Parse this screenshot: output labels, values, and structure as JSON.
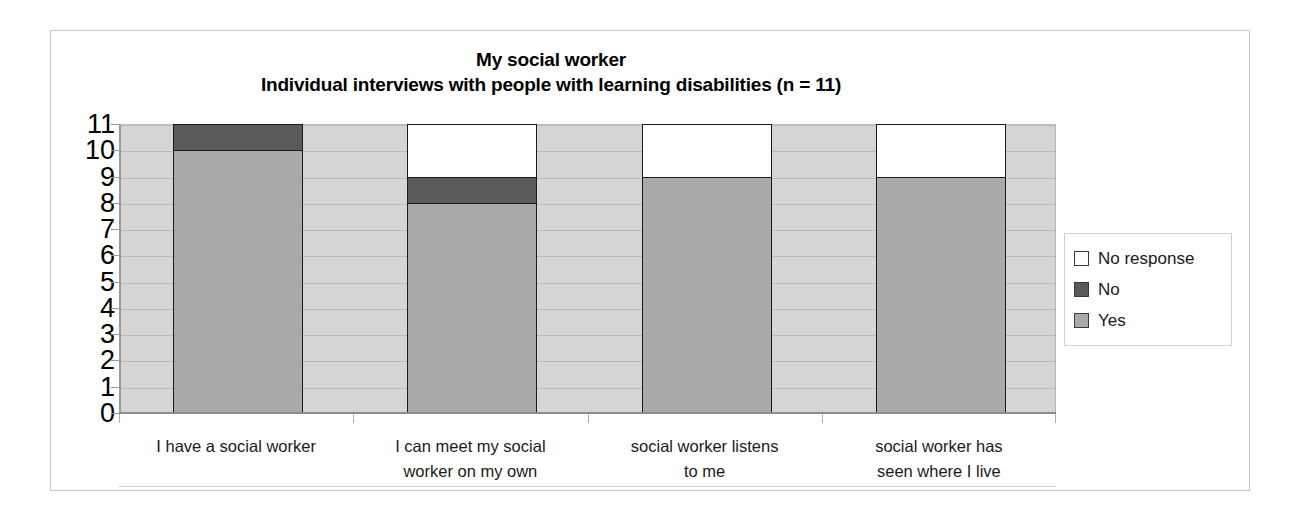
{
  "chart_data": {
    "type": "bar",
    "stacked": true,
    "title": "My social worker\nIndividual interviews with people with learning disabilities (n = 11)",
    "title_line1": "My social worker",
    "title_line2": "Individual interviews with people with learning disabilities (n = 11)",
    "xlabel": "",
    "ylabel": "",
    "ylim": [
      0,
      11
    ],
    "yticks": [
      0,
      1,
      2,
      3,
      4,
      5,
      6,
      7,
      8,
      9,
      10,
      11
    ],
    "ytick_labels": [
      "0",
      "1",
      "2",
      "3",
      "4",
      "5",
      "6",
      "7",
      "8",
      "9",
      "10",
      "11"
    ],
    "grid": true,
    "legend_position": "right",
    "categories": [
      "I have a social worker",
      "I can meet my social worker on my own",
      "social worker listens to me",
      "social worker has seen where I live"
    ],
    "category_lines": [
      [
        "I have a social worker"
      ],
      [
        "I can meet my social",
        "worker on my own"
      ],
      [
        "social worker listens",
        "to me"
      ],
      [
        "social worker has",
        "seen where I live"
      ]
    ],
    "series": [
      {
        "name": "Yes",
        "color": "#a9a9a9",
        "values": [
          10,
          8,
          9,
          9
        ]
      },
      {
        "name": "No",
        "color": "#5a5a5a",
        "values": [
          1,
          1,
          0,
          0
        ]
      },
      {
        "name": "No response",
        "color": "#ffffff",
        "values": [
          0,
          2,
          2,
          2
        ]
      }
    ],
    "legend_entries": [
      {
        "label": "No response",
        "color": "#ffffff"
      },
      {
        "label": "No",
        "color": "#5a5a5a"
      },
      {
        "label": "Yes",
        "color": "#a9a9a9"
      }
    ],
    "plot_background": "#d5d5d5",
    "bar_outline": "#1a1a1a"
  }
}
